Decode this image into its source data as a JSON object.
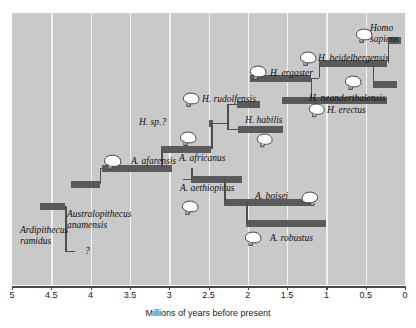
{
  "chart_data": {
    "type": "bar",
    "title": "",
    "xlabel": "Millions of years before present",
    "ylabel": "",
    "xlim": [
      5,
      0
    ],
    "x_ticks": [
      "5",
      "4.5",
      "4",
      "3.5",
      "3",
      "2.5",
      "2",
      "1.5",
      "1",
      "0.5",
      "0"
    ],
    "x_tick_values": [
      5,
      4.5,
      4,
      3.5,
      3,
      2.5,
      2,
      1.5,
      1,
      0.5,
      0
    ],
    "grid": true,
    "legend": "none",
    "orientation": "horizontal-range-bars",
    "axis_direction": "reversed",
    "bar_color": "#5a5a5c",
    "background_color": "#c9c9c9",
    "gridline_color": "#f2f2f2",
    "categories": [
      "Ardipithecus ramidus",
      "Australopithecus anamensis",
      "A. afarensis",
      "A. africanus",
      "A. aethiopicus",
      "A. boisei",
      "A. robustus",
      "H. sp.?",
      "H. rudolfensis",
      "H. habilis",
      "H. ergaster",
      "H. erectus",
      "H. heidelbergensis",
      "H. neanderthalensis",
      "Homo sapiens"
    ],
    "ranges": [
      {
        "name": "Ardipithecus ramidus",
        "start": 4.65,
        "end": 4.32,
        "row": 11
      },
      {
        "name": "Australopithecus anamensis",
        "start": 4.25,
        "end": 3.88,
        "row": 9
      },
      {
        "name": "A. afarensis",
        "start": 3.85,
        "end": 2.96,
        "row": 7
      },
      {
        "name": "A. africanus",
        "start": 3.1,
        "end": 2.47,
        "row": 6
      },
      {
        "name": "A. aethiopicus",
        "start": 2.72,
        "end": 2.07,
        "row": 8
      },
      {
        "name": "A. boisei",
        "start": 2.3,
        "end": 1.18,
        "row": 10
      },
      {
        "name": "A. robustus",
        "start": 2.02,
        "end": 1.0,
        "row": 12
      },
      {
        "name": "H. sp.?",
        "start": 2.49,
        "end": 2.44,
        "row": 4
      },
      {
        "name": "H. rudolfensis",
        "start": 2.14,
        "end": 1.84,
        "row": 3
      },
      {
        "name": "H. habilis",
        "start": 2.13,
        "end": 1.55,
        "row": 5
      },
      {
        "name": "H. ergaster",
        "start": 1.97,
        "end": 1.2,
        "row": 2
      },
      {
        "name": "H. erectus",
        "start": 1.57,
        "end": 0.23,
        "row": 2.5
      },
      {
        "name": "H. heidelbergensis",
        "start": 1.1,
        "end": 0.23,
        "row": 1
      },
      {
        "name": "H. neanderthalensis",
        "start": 0.41,
        "end": 0.1,
        "row": 1.5
      },
      {
        "name": "Homo sapiens",
        "start": 0.22,
        "end": 0.05,
        "row": 0
      }
    ],
    "lineage_links": [
      {
        "from": "Ardipithecus ramidus",
        "to": "?"
      },
      {
        "from": "Australopithecus anamensis",
        "to": "A. afarensis"
      },
      {
        "from": "A. afarensis",
        "to": "A. africanus"
      },
      {
        "from": "A. afarensis",
        "to": "A. aethiopicus"
      },
      {
        "from": "A. aethiopicus",
        "to": "A. boisei"
      },
      {
        "from": "A. boisei",
        "to": "A. robustus"
      },
      {
        "from": "A. africanus",
        "to": "H. sp.?"
      },
      {
        "from": "H. sp.?",
        "to": "H. rudolfensis"
      },
      {
        "from": "H. sp.?",
        "to": "H. habilis"
      },
      {
        "from": "H. ergaster",
        "to": "H. erectus"
      },
      {
        "from": "H. ergaster",
        "to": "H. heidelbergensis"
      },
      {
        "from": "H. heidelbergensis",
        "to": "H. neanderthalensis"
      },
      {
        "from": "H. heidelbergensis",
        "to": "Homo sapiens"
      }
    ]
  },
  "labels": {
    "ardipithecus_ramidus": "Ardipithecus\nramidus",
    "ardipithecus_ramidus_l1": "Ardipithecus",
    "ardipithecus_ramidus_l2": "ramidus",
    "australopithecus_anamensis_l1": "Australopithecus",
    "australopithecus_anamensis_l2": "anamensis",
    "a_afarensis": "A. afarensis",
    "a_africanus": "A. africanus",
    "a_aethiopicus": "A. aethiopicus",
    "a_boisei": "A. boisei",
    "a_robustus": "A. robustus",
    "h_sp_unknown": "H. sp.?",
    "h_rudolfensis": "H. rudolfensis",
    "h_habilis": "H. habilis",
    "h_ergaster": "H. ergaster",
    "h_erectus": "H. erectus",
    "h_heidelbergensis": "H. heidelbergensis",
    "h_neanderthalensis": "H. neanderthalensis",
    "homo_sapiens_l1": "Homo",
    "homo_sapiens_l2": "sapiens",
    "question_mark": "?"
  },
  "axis": {
    "title": "Millions of years before present",
    "ticks": [
      "5",
      "4.5",
      "4",
      "3.5",
      "3",
      "2.5",
      "2",
      "1.5",
      "1",
      "0.5",
      "0"
    ]
  }
}
